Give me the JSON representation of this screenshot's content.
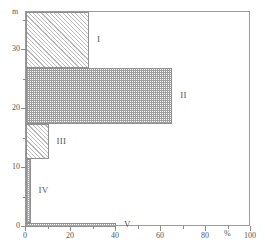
{
  "chart": {
    "y_axis": {
      "unit_caption": "m",
      "tick_labels": [
        "0",
        "10",
        "20",
        "30"
      ],
      "tick_values": [
        0,
        10,
        20,
        30
      ],
      "minor_tick_values": [
        5,
        15,
        25,
        35
      ]
    },
    "x_axis": {
      "unit_caption": "%",
      "tick_labels": [
        "0",
        "20",
        "40",
        "60",
        "80",
        "100"
      ],
      "tick_values": [
        0,
        20,
        40,
        60,
        80,
        100
      ],
      "minor_tick_values": [
        10,
        30,
        50,
        70,
        90
      ]
    },
    "bars": [
      {
        "label": "I",
        "y_bottom": 27.0,
        "y_top": 36.5,
        "value": 28,
        "fill": "hatch-diag"
      },
      {
        "label": "II",
        "y_bottom": 17.5,
        "y_top": 27.0,
        "value": 65,
        "fill": "hatch-cross"
      },
      {
        "label": "III",
        "y_bottom": 11.5,
        "y_top": 17.5,
        "value": 10,
        "fill": "hatch-diag"
      },
      {
        "label": "IV",
        "y_bottom": 0.7,
        "y_top": 11.5,
        "value": 2,
        "fill": "stipple"
      },
      {
        "label": "V",
        "y_bottom": 0.0,
        "y_top": 0.7,
        "value": 40,
        "fill": "stipple"
      }
    ]
  },
  "chart_data": {
    "type": "bar",
    "orientation": "horizontal",
    "title": "",
    "xlabel": "%",
    "ylabel": "m",
    "xlim": [
      0,
      100
    ],
    "ylim": [
      0,
      36.5
    ],
    "grid": false,
    "legend": "none",
    "categories": [
      "I",
      "II",
      "III",
      "IV",
      "V"
    ],
    "values": [
      28,
      65,
      10,
      2,
      40
    ],
    "y_intervals": [
      [
        27.0,
        36.5
      ],
      [
        17.5,
        27.0
      ],
      [
        11.5,
        17.5
      ],
      [
        0.7,
        11.5
      ],
      [
        0.0,
        0.7
      ]
    ],
    "x_tick_labels": [
      "0",
      "20",
      "40",
      "60",
      "80",
      "100"
    ],
    "y_tick_labels": [
      "0",
      "10",
      "20",
      "30"
    ],
    "annotations": [
      "I",
      "II",
      "III",
      "IV",
      "V"
    ]
  }
}
